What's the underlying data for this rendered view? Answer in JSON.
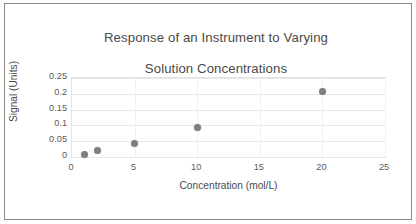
{
  "figure": {
    "border_color": "#8a8a8a",
    "background": "#ffffff"
  },
  "chart_data": {
    "type": "scatter",
    "title": "Response of an Instrument to Varying\nSolution Concentrations",
    "title_line1": "Response of an Instrument to Varying",
    "title_line2": "Solution Concentrations",
    "xlabel": "Concentration (mol/L)",
    "ylabel": "Signal (Units)",
    "xlim": [
      0,
      25
    ],
    "ylim": [
      0,
      0.25
    ],
    "xticks": [
      "0",
      "5",
      "10",
      "15",
      "20",
      "25"
    ],
    "xtick_values": [
      0,
      5,
      10,
      15,
      20,
      25
    ],
    "yticks": [
      "0",
      "0.05",
      "0.1",
      "0.15",
      "0.2",
      "0.25"
    ],
    "ytick_values": [
      0,
      0.05,
      0.1,
      0.15,
      0.2,
      0.25
    ],
    "grid": "horizontal-and-vertical",
    "legend": "none",
    "marker_color": "#7f7f7f",
    "marker_shape": "circle",
    "x": [
      1,
      2,
      5,
      10,
      20
    ],
    "y": [
      0.009,
      0.022,
      0.044,
      0.094,
      0.208
    ],
    "points": [
      {
        "x": 1,
        "y": 0.009
      },
      {
        "x": 2,
        "y": 0.022
      },
      {
        "x": 5,
        "y": 0.044
      },
      {
        "x": 10,
        "y": 0.094
      },
      {
        "x": 20,
        "y": 0.208
      }
    ]
  }
}
